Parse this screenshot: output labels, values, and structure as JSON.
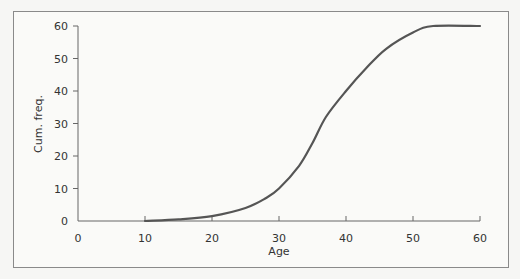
{
  "chart_data": {
    "type": "line",
    "title": "",
    "xlabel": "Age",
    "ylabel": "Cum. freq.",
    "xlim": [
      0,
      60
    ],
    "ylim": [
      0,
      60
    ],
    "x_ticks": [
      0,
      10,
      20,
      30,
      40,
      50,
      60
    ],
    "y_ticks": [
      0,
      10,
      20,
      30,
      40,
      50,
      60
    ],
    "grid": false,
    "legend": null,
    "series": [
      {
        "name": "Cumulative frequency",
        "color": "#555555",
        "x": [
          10,
          15,
          20,
          25,
          28,
          30,
          33,
          35,
          37,
          40,
          43,
          46,
          50,
          53,
          60
        ],
        "y": [
          0,
          0.5,
          1.5,
          4,
          7,
          10,
          17,
          24,
          32,
          40,
          47,
          53,
          58,
          60,
          60
        ]
      }
    ]
  },
  "labels": {
    "x_axis_title": "Age",
    "y_axis_title": "Cum. freq.",
    "x_tick_labels": [
      "0",
      "10",
      "20",
      "30",
      "40",
      "50",
      "60"
    ],
    "y_tick_labels": [
      "0",
      "10",
      "20",
      "30",
      "40",
      "50",
      "60"
    ]
  }
}
